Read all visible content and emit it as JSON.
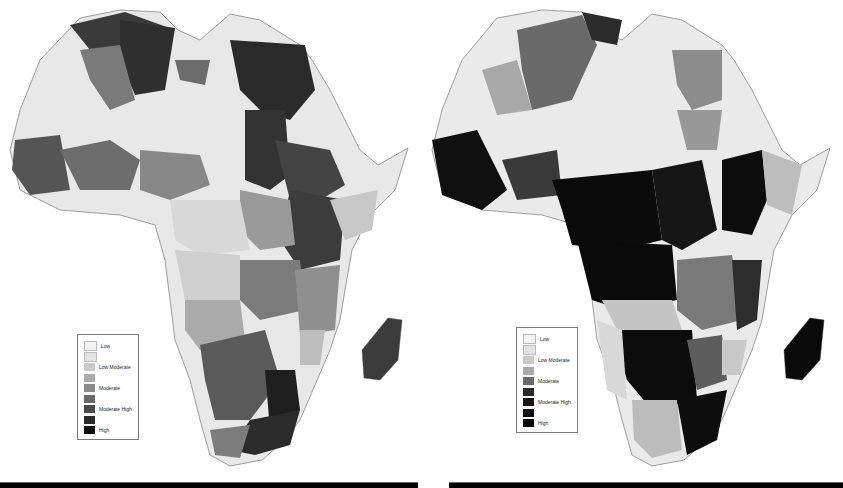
{
  "figure": {
    "type": "choropleth-pair",
    "region": "Africa",
    "colorscale": "grayscale"
  },
  "legend_levels": [
    {
      "label": "Low",
      "color": "#f2f2f2"
    },
    {
      "label": "",
      "color": "#e2e2e2"
    },
    {
      "label": "Low Moderate",
      "color": "#c9c9c9"
    },
    {
      "label": "",
      "color": "#aaaaaa"
    },
    {
      "label": "Moderate",
      "color": "#8a8a8a"
    },
    {
      "label": "",
      "color": "#6a6a6a"
    },
    {
      "label": "Moderate High",
      "color": "#4a4a4a"
    },
    {
      "label": "",
      "color": "#2a2a2a"
    },
    {
      "label": "High",
      "color": "#0e0e0e"
    }
  ],
  "maps": {
    "left": {
      "legend": [
        "Low",
        "",
        "Low Moderate",
        "",
        "Moderate",
        "",
        "Moderate High",
        "",
        "High"
      ]
    },
    "right": {
      "legend": [
        "Low",
        "",
        "Low Moderate",
        "",
        "Moderate",
        "",
        "Moderate High",
        "",
        "High"
      ]
    }
  }
}
